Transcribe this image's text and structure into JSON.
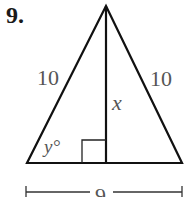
{
  "problem": {
    "number": "9."
  },
  "figure": {
    "type": "isosceles-triangle-with-altitude",
    "left_side_label": "10",
    "right_side_label": "10",
    "altitude_label": "x",
    "angle_label": "y°",
    "base_label": "9",
    "right_angle_marker": true,
    "stroke_color": "#111111",
    "label_color": "#555555"
  }
}
